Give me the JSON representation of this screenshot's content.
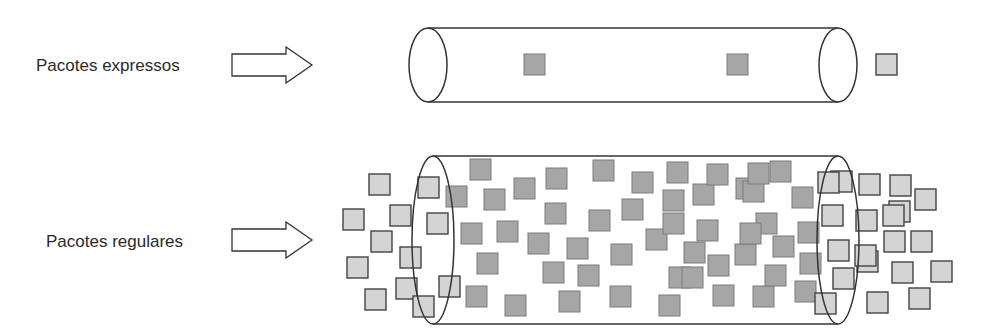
{
  "colors": {
    "background": "#ffffff",
    "stroke": "#333333",
    "inner_packet_fill": "#a6a6a6",
    "outer_packet_fill": "#d4d4d4",
    "text": "#2a2a2a"
  },
  "rows": [
    {
      "id": "express",
      "label": "Pacotes expressos",
      "arrow": {
        "x": 232,
        "y": 54,
        "w": 80,
        "h": 22
      },
      "pipe": {
        "x1": 428,
        "x2": 838,
        "cy": 65,
        "rx": 19,
        "ry": 37
      },
      "packets_inside": [
        [
          524,
          54
        ],
        [
          727,
          54
        ]
      ],
      "packets_outside": [
        [
          876,
          54
        ]
      ]
    },
    {
      "id": "regular",
      "label": "Pacotes regulares",
      "arrow": {
        "x": 232,
        "y": 229,
        "w": 80,
        "h": 22
      },
      "pipe": {
        "x1": 433,
        "x2": 838,
        "cy": 240,
        "rx": 21,
        "ry": 84
      },
      "packets_outside": [
        [
          369,
          174
        ],
        [
          343,
          209
        ],
        [
          371,
          231
        ],
        [
          347,
          257
        ],
        [
          365,
          289
        ],
        [
          390,
          205
        ],
        [
          400,
          247
        ],
        [
          396,
          278
        ],
        [
          418,
          177
        ],
        [
          427,
          213
        ],
        [
          413,
          296
        ],
        [
          439,
          276
        ],
        [
          831,
          171
        ],
        [
          859,
          174
        ],
        [
          822,
          205
        ],
        [
          856,
          210
        ],
        [
          889,
          201
        ],
        [
          915,
          189
        ],
        [
          828,
          240
        ],
        [
          857,
          251
        ],
        [
          884,
          231
        ],
        [
          911,
          231
        ],
        [
          833,
          268
        ],
        [
          892,
          262
        ],
        [
          931,
          261
        ],
        [
          867,
          292
        ],
        [
          909,
          288
        ],
        [
          815,
          293
        ],
        [
          855,
          245
        ],
        [
          883,
          205
        ],
        [
          890,
          175
        ],
        [
          818,
          172
        ]
      ],
      "packets_inside": [
        [
          446,
          186
        ],
        [
          470,
          159
        ],
        [
          484,
          189
        ],
        [
          461,
          223
        ],
        [
          477,
          253
        ],
        [
          466,
          286
        ],
        [
          505,
          295
        ],
        [
          497,
          221
        ],
        [
          514,
          178
        ],
        [
          545,
          203
        ],
        [
          543,
          262
        ],
        [
          528,
          233
        ],
        [
          546,
          168
        ],
        [
          567,
          238
        ],
        [
          559,
          291
        ],
        [
          593,
          160
        ],
        [
          589,
          210
        ],
        [
          578,
          265
        ],
        [
          610,
          286
        ],
        [
          622,
          199
        ],
        [
          611,
          244
        ],
        [
          632,
          172
        ],
        [
          646,
          229
        ],
        [
          663,
          190
        ],
        [
          659,
          295
        ],
        [
          667,
          162
        ],
        [
          669,
          267
        ],
        [
          693,
          184
        ],
        [
          684,
          242
        ],
        [
          707,
          164
        ],
        [
          682,
          267
        ],
        [
          708,
          255
        ],
        [
          697,
          220
        ],
        [
          713,
          285
        ],
        [
          736,
          178
        ],
        [
          735,
          244
        ],
        [
          753,
          286
        ],
        [
          756,
          213
        ],
        [
          743,
          181
        ],
        [
          765,
          265
        ],
        [
          770,
          161
        ],
        [
          773,
          236
        ],
        [
          795,
          281
        ],
        [
          792,
          187
        ],
        [
          800,
          253
        ],
        [
          798,
          222
        ],
        [
          748,
          163
        ],
        [
          663,
          213
        ],
        [
          740,
          223
        ]
      ]
    }
  ],
  "packet_size": 21
}
